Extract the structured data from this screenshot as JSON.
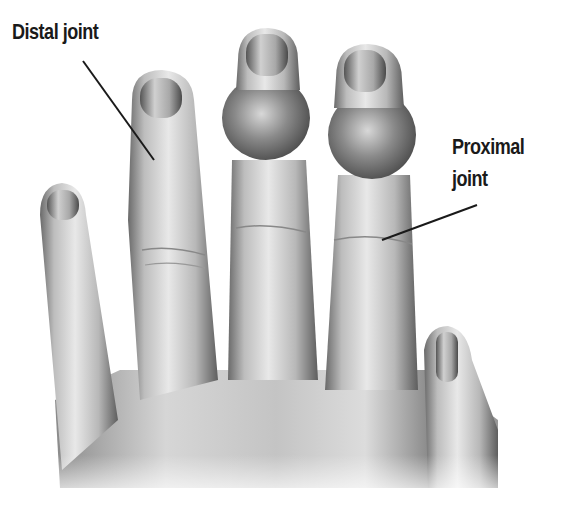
{
  "labels": {
    "distal": "Distal joint",
    "proximal_line1": "Proximal",
    "proximal_line2": "joint"
  },
  "colors": {
    "text": "#1a1a1a",
    "skin_light": "#e6e6e6",
    "skin_mid": "#b5b5b5",
    "skin_dark": "#5a5a5a",
    "leader_line": "#1a1a1a"
  }
}
